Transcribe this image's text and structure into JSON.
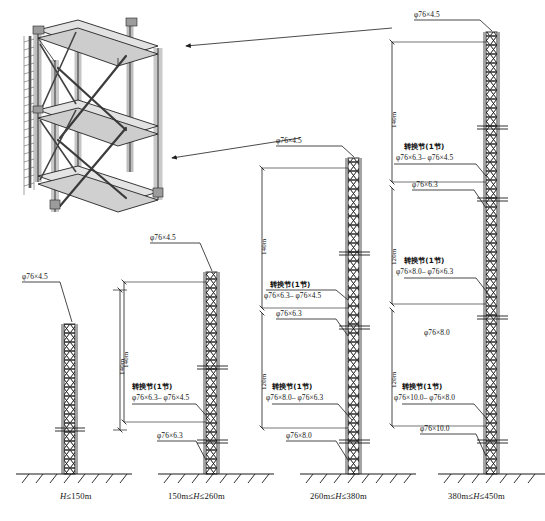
{
  "figure": {
    "type": "engineering-elevation-diagram",
    "pipe_prefix": "φ",
    "transition_label_cn": "转换节(1节)",
    "units": "m"
  },
  "isometric": {
    "name": "mast-section-3d",
    "description": "3D isometric view of one lattice mast section with four chords, horizontal frames and X bracing"
  },
  "towers": [
    {
      "id": "tower-1",
      "caption": "H≤150m",
      "caption_parts": {
        "pre": "",
        "italic": "H",
        "post": "≤150m"
      },
      "dimensions": [
        {
          "text": "140m",
          "value": 140
        }
      ],
      "callouts": [
        {
          "text": "φ76×4.5",
          "kind": "pipe"
        }
      ],
      "transitions": []
    },
    {
      "id": "tower-2",
      "caption": "150m≤H≤260m",
      "caption_parts": {
        "pre": "150m≤",
        "italic": "H",
        "post": "≤260m"
      },
      "dimensions": [
        {
          "text": "140m",
          "value": 140
        }
      ],
      "callouts": [
        {
          "text": "φ76×4.5",
          "kind": "pipe"
        },
        {
          "text": "φ76×6.3",
          "kind": "pipe"
        }
      ],
      "transitions": [
        {
          "title": "转换节(1节)",
          "spec": "φ76×6.3– φ76×4.5"
        }
      ]
    },
    {
      "id": "tower-3",
      "caption": "260m≤H≤380m",
      "caption_parts": {
        "pre": "260m≤",
        "italic": "H",
        "post": "≤380m"
      },
      "dimensions": [
        {
          "text": "140m",
          "value": 140
        },
        {
          "text": "120m",
          "value": 120
        }
      ],
      "callouts": [
        {
          "text": "φ76×4.5",
          "kind": "pipe"
        },
        {
          "text": "φ76×6.3",
          "kind": "pipe"
        },
        {
          "text": "φ76×8.0",
          "kind": "pipe"
        }
      ],
      "transitions": [
        {
          "title": "转换节(1节)",
          "spec": "φ76×6.3– φ76×4.5"
        },
        {
          "title": "转换节(1节)",
          "spec": "φ76×8.0– φ76×6.3"
        }
      ]
    },
    {
      "id": "tower-4",
      "caption": "380m≤H≤450m",
      "caption_parts": {
        "pre": "380m≤",
        "italic": "H",
        "post": "≤450m"
      },
      "dimensions": [
        {
          "text": "140m",
          "value": 140
        },
        {
          "text": "120m",
          "value": 120
        },
        {
          "text": "120m",
          "value": 120
        }
      ],
      "callouts": [
        {
          "text": "φ76×4.5",
          "kind": "pipe"
        },
        {
          "text": "φ76×6.3",
          "kind": "pipe"
        },
        {
          "text": "φ76×8.0",
          "kind": "pipe"
        },
        {
          "text": "φ76×10.0",
          "kind": "pipe"
        }
      ],
      "transitions": [
        {
          "title": "转换节(1节)",
          "spec": "φ76×6.3– φ76×4.5"
        },
        {
          "title": "转换节(1节)",
          "spec": "φ76×8.0– φ76×6.3"
        },
        {
          "title": "转换节(1节)",
          "spec": "φ76×10.0– φ76×8.0"
        }
      ]
    }
  ],
  "colors": {
    "line": "#1d1d1d",
    "fill_light": "#cfcfcf",
    "fill_mid": "#9a9a9a",
    "background": "#ffffff"
  }
}
